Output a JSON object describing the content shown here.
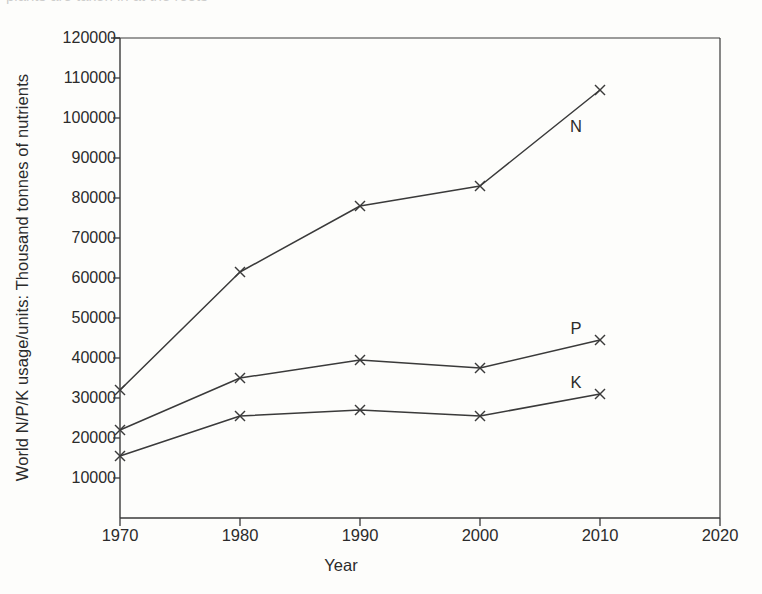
{
  "figure": {
    "cut_text_top": "plants are taken in at the roots",
    "background_color": "#fdfdfb",
    "line_color": "#3a3a3a"
  },
  "chart_data": {
    "type": "line",
    "title": "",
    "xlabel": "Year",
    "ylabel": "World N/P/K usage/units: Thousand tonnes of nutrients",
    "x": [
      1970,
      1980,
      1990,
      2000,
      2010
    ],
    "xlim": [
      1970,
      2020
    ],
    "ylim": [
      0,
      120000
    ],
    "xticks": [
      1970,
      1980,
      1990,
      2000,
      2010,
      2020
    ],
    "xticklabels": [
      "1970",
      "1980",
      "1990",
      "2000",
      "2010",
      "2020"
    ],
    "yticks": [
      10000,
      20000,
      30000,
      40000,
      50000,
      60000,
      70000,
      80000,
      90000,
      100000,
      110000,
      120000
    ],
    "yticklabels": [
      "10000",
      "20000",
      "30000",
      "40000",
      "50000",
      "60000",
      "70000",
      "80000",
      "90000",
      "100000",
      "110000",
      "120000"
    ],
    "grid": false,
    "legend": "inline-series-labels",
    "marker": "x",
    "series": [
      {
        "name": "N",
        "label": "N",
        "label_x": 2008,
        "label_y": 98000,
        "values": [
          32000,
          61500,
          78000,
          83000,
          107000
        ]
      },
      {
        "name": "P",
        "label": "P",
        "label_x": 2008,
        "label_y": 47500,
        "values": [
          22000,
          35000,
          39500,
          37500,
          44500
        ]
      },
      {
        "name": "K",
        "label": "K",
        "label_x": 2008,
        "label_y": 34000,
        "values": [
          15500,
          25500,
          27000,
          25500,
          31000
        ]
      }
    ]
  }
}
